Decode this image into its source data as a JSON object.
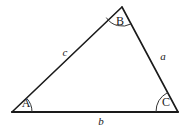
{
  "figure": {
    "background_color": "#ffffff",
    "stroke_color": "#1a1a1a",
    "arc_color": "#333333"
  },
  "vertices": [
    {
      "id": "A",
      "label": "A",
      "x": 12,
      "y": 112,
      "label_x": 26,
      "label_y": 104,
      "arc_radius": 20
    },
    {
      "id": "B",
      "label": "B",
      "x": 122,
      "y": 7,
      "label_x": 120,
      "label_y": 22,
      "arc_radius": 19
    },
    {
      "id": "C",
      "label": "C",
      "x": 178,
      "y": 112,
      "label_x": 166,
      "label_y": 103,
      "arc_radius": 22
    }
  ],
  "sides": [
    {
      "id": "c",
      "label": "c",
      "from": "A",
      "to": "B",
      "label_x": 65,
      "label_y": 53
    },
    {
      "id": "a",
      "label": "a",
      "from": "B",
      "to": "C",
      "label_x": 163,
      "label_y": 57
    },
    {
      "id": "b",
      "label": "b",
      "from": "A",
      "to": "C",
      "label_x": 101,
      "label_y": 122
    }
  ],
  "arcs": {
    "A": "M 32 112 A 20 20 0 0 0 26.6 98.2",
    "B": "M 106.3 17.6 A 19 19 0 0 0 131.3 23.8",
    "C": "M 156 112 A 22 22 0 0 1 167.4 92.7"
  },
  "edges": {
    "c": "M 12 112 L 122 7",
    "a": "M 122 7 L 178 112",
    "b": "M 12 112 L 178 112"
  }
}
